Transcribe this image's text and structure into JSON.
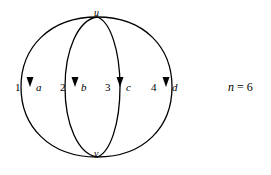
{
  "figure": {
    "stroke_color": "#000000",
    "background_color": "#ffffff",
    "vertices": [
      {
        "id": "u",
        "label": "u",
        "x": 97,
        "y": 17,
        "label_x": 94,
        "label_y": 8
      },
      {
        "id": "v",
        "label": "v",
        "x": 97,
        "y": 157,
        "label_x": 94,
        "label_y": 150
      }
    ],
    "edges": [
      {
        "id": "1",
        "index": "1",
        "name": "a",
        "index_x": 17,
        "name_x": 38,
        "label_y": 82,
        "arrow_x": 31,
        "arrow_y": 81,
        "mid_x": 21
      },
      {
        "id": "2",
        "index": "2",
        "name": "b",
        "index_x": 61,
        "name_x": 82,
        "label_y": 82,
        "arrow_x": 75,
        "arrow_y": 81,
        "mid_x": 65
      },
      {
        "id": "3",
        "index": "3",
        "name": "c",
        "index_x": 106,
        "name_x": 127,
        "label_y": 82,
        "arrow_x": 120,
        "arrow_y": 81,
        "mid_x": 113
      },
      {
        "id": "4",
        "index": "4",
        "name": "d",
        "index_x": 152,
        "name_x": 173,
        "label_y": 82,
        "arrow_x": 166,
        "arrow_y": 81,
        "mid_x": 172
      }
    ],
    "arrow_direction": "down"
  },
  "annotation": {
    "variable": "n",
    "equals": " = ",
    "value": "6",
    "full_text": "n = 6"
  }
}
